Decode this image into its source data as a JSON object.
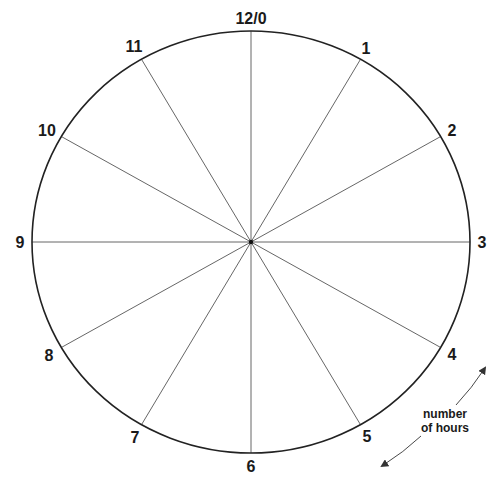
{
  "diagram": {
    "center": {
      "x": 251,
      "y": 242
    },
    "radius": {
      "x": 219,
      "y": 211
    },
    "outline_color": "#222222",
    "spoke_color": "#555555",
    "hour_labels": [
      {
        "text": "12/0",
        "x": 251,
        "y": 24
      },
      {
        "text": "1",
        "x": 366,
        "y": 54
      },
      {
        "text": "2",
        "x": 452,
        "y": 136
      },
      {
        "text": "3",
        "x": 482,
        "y": 248
      },
      {
        "text": "4",
        "x": 452,
        "y": 360
      },
      {
        "text": "5",
        "x": 367,
        "y": 442
      },
      {
        "text": "6",
        "x": 251,
        "y": 472
      },
      {
        "text": "7",
        "x": 135,
        "y": 443
      },
      {
        "text": "8",
        "x": 49,
        "y": 361
      },
      {
        "text": "9",
        "x": 20,
        "y": 248
      },
      {
        "text": "10",
        "x": 47,
        "y": 136
      },
      {
        "text": "11",
        "x": 134,
        "y": 52
      }
    ],
    "annotation": {
      "line1": "number",
      "line2": "of hours",
      "arrow": "double-headed curved arrow along clock rim"
    }
  }
}
